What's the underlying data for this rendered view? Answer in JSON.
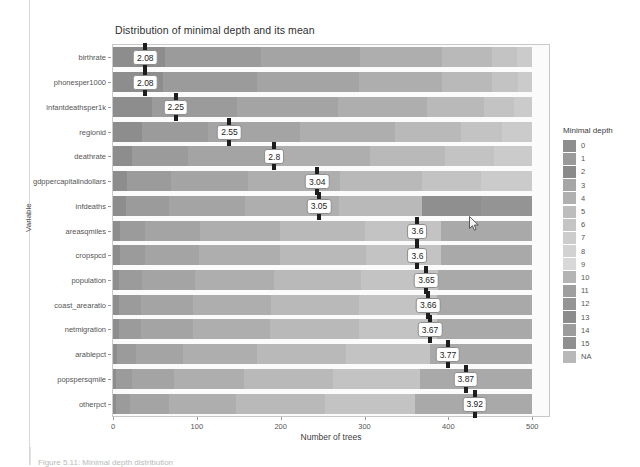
{
  "figure": {
    "caption": "Figure 5.11: Minimal depth distribution"
  },
  "chart_data": {
    "type": "bar",
    "title": "Distribution of minimal depth and its mean",
    "xlabel": "Number of trees",
    "ylabel": "Variable",
    "xlim": [
      0,
      520
    ],
    "xticks": [
      0,
      100,
      200,
      300,
      400,
      500
    ],
    "xtick_labels": [
      "0",
      "100",
      "200",
      "300",
      "400",
      "500"
    ],
    "grid": false,
    "orientation": "horizontal",
    "stacked": true,
    "legend": {
      "title": "Minimal depth",
      "position": "right",
      "entries": [
        {
          "label": "0",
          "color": "#8e8e8e"
        },
        {
          "label": "1",
          "color": "#9a9a9a"
        },
        {
          "label": "2",
          "color": "#8a8a8a"
        },
        {
          "label": "3",
          "color": "#a6a6a6"
        },
        {
          "label": "4",
          "color": "#b0b0b0"
        },
        {
          "label": "5",
          "color": "#bdbdbd"
        },
        {
          "label": "6",
          "color": "#c4c4c4"
        },
        {
          "label": "7",
          "color": "#cccccc"
        },
        {
          "label": "8",
          "color": "#d2d2d2"
        },
        {
          "label": "9",
          "color": "#d8d8d8"
        },
        {
          "label": "10",
          "color": "#b4b4b4"
        },
        {
          "label": "11",
          "color": "#9f9f9f"
        },
        {
          "label": "12",
          "color": "#949494"
        },
        {
          "label": "13",
          "color": "#8c8c8c"
        },
        {
          "label": "14",
          "color": "#9c9c9c"
        },
        {
          "label": "15",
          "color": "#8f8f8f"
        },
        {
          "label": "NA",
          "color": "#b8b8b8"
        }
      ]
    },
    "categories": [
      "birthrate",
      "phonesper1000",
      "infantdeathsper1k",
      "regionid",
      "deathrate",
      "gdppercapitalindollars",
      "infdeaths",
      "areasqmiles",
      "cropspcd",
      "population",
      "coast_arearatio",
      "netmigration",
      "arablepct",
      "popspersqmile",
      "otherpct"
    ],
    "mean_label": "mean minimal depth",
    "values": [
      2.08,
      2.08,
      2.25,
      2.55,
      2.8,
      3.04,
      3.05,
      3.6,
      3.6,
      3.65,
      3.66,
      3.67,
      3.77,
      3.87,
      3.92
    ],
    "value_labels": [
      "2.08",
      "2.08",
      "2.25",
      "2.55",
      "2.8",
      "3.04",
      "3.05",
      "3.6",
      "3.6",
      "3.65",
      "3.66",
      "3.67",
      "3.77",
      "3.87",
      "3.92"
    ],
    "total_trees": 500,
    "bars": [
      {
        "category": "birthrate",
        "mean": 2.08,
        "mean_label": "2.08",
        "segments": [
          {
            "depth": "0",
            "count": 62,
            "color": "#8d8d8d"
          },
          {
            "depth": "1",
            "count": 114,
            "color": "#9b9b9b"
          },
          {
            "depth": "2",
            "count": 119,
            "color": "#a4a4a4"
          },
          {
            "depth": "3",
            "count": 98,
            "color": "#aeaeae"
          },
          {
            "depth": "4",
            "count": 59,
            "color": "#b9b9b9"
          },
          {
            "depth": "5",
            "count": 30,
            "color": "#c3c3c3"
          },
          {
            "depth": "6",
            "count": 18,
            "color": "#cbcbcb"
          }
        ]
      },
      {
        "category": "phonesper1000",
        "mean": 2.08,
        "mean_label": "2.08",
        "segments": [
          {
            "depth": "0",
            "count": 60,
            "color": "#8d8d8d"
          },
          {
            "depth": "1",
            "count": 112,
            "color": "#9b9b9b"
          },
          {
            "depth": "2",
            "count": 121,
            "color": "#a4a4a4"
          },
          {
            "depth": "3",
            "count": 99,
            "color": "#aeaeae"
          },
          {
            "depth": "4",
            "count": 60,
            "color": "#b9b9b9"
          },
          {
            "depth": "5",
            "count": 31,
            "color": "#c3c3c3"
          },
          {
            "depth": "6",
            "count": 17,
            "color": "#cbcbcb"
          }
        ]
      },
      {
        "category": "infantdeathsper1k",
        "mean": 2.25,
        "mean_label": "2.25",
        "segments": [
          {
            "depth": "0",
            "count": 47,
            "color": "#8d8d8d"
          },
          {
            "depth": "1",
            "count": 101,
            "color": "#9b9b9b"
          },
          {
            "depth": "2",
            "count": 120,
            "color": "#a4a4a4"
          },
          {
            "depth": "3",
            "count": 106,
            "color": "#aeaeae"
          },
          {
            "depth": "4",
            "count": 68,
            "color": "#b9b9b9"
          },
          {
            "depth": "5",
            "count": 36,
            "color": "#c3c3c3"
          },
          {
            "depth": "6",
            "count": 22,
            "color": "#cbcbcb"
          }
        ]
      },
      {
        "category": "regionid",
        "mean": 2.55,
        "mean_label": "2.55",
        "segments": [
          {
            "depth": "0",
            "count": 34,
            "color": "#8d8d8d"
          },
          {
            "depth": "1",
            "count": 79,
            "color": "#9b9b9b"
          },
          {
            "depth": "2",
            "count": 110,
            "color": "#a4a4a4"
          },
          {
            "depth": "3",
            "count": 113,
            "color": "#aeaeae"
          },
          {
            "depth": "4",
            "count": 79,
            "color": "#b9b9b9"
          },
          {
            "depth": "5",
            "count": 49,
            "color": "#c3c3c3"
          },
          {
            "depth": "6",
            "count": 36,
            "color": "#cbcbcb"
          }
        ]
      },
      {
        "category": "deathrate",
        "mean": 2.8,
        "mean_label": "2.8",
        "segments": [
          {
            "depth": "0",
            "count": 23,
            "color": "#8d8d8d"
          },
          {
            "depth": "1",
            "count": 66,
            "color": "#9b9b9b"
          },
          {
            "depth": "2",
            "count": 103,
            "color": "#a4a4a4"
          },
          {
            "depth": "3",
            "count": 114,
            "color": "#aeaeae"
          },
          {
            "depth": "4",
            "count": 90,
            "color": "#b9b9b9"
          },
          {
            "depth": "5",
            "count": 58,
            "color": "#c3c3c3"
          },
          {
            "depth": "6",
            "count": 46,
            "color": "#cbcbcb"
          }
        ]
      },
      {
        "category": "gdppercapitalindollars",
        "mean": 3.04,
        "mean_label": "3.04",
        "segments": [
          {
            "depth": "0",
            "count": 17,
            "color": "#8d8d8d"
          },
          {
            "depth": "1",
            "count": 52,
            "color": "#9b9b9b"
          },
          {
            "depth": "2",
            "count": 92,
            "color": "#a4a4a4"
          },
          {
            "depth": "3",
            "count": 110,
            "color": "#aeaeae"
          },
          {
            "depth": "4",
            "count": 98,
            "color": "#b9b9b9"
          },
          {
            "depth": "5",
            "count": 70,
            "color": "#c3c3c3"
          },
          {
            "depth": "6",
            "count": 61,
            "color": "#cbcbcb"
          }
        ]
      },
      {
        "category": "infdeaths",
        "mean": 3.05,
        "mean_label": "3.05",
        "segments": [
          {
            "depth": "0",
            "count": 16,
            "color": "#8d8d8d"
          },
          {
            "depth": "1",
            "count": 51,
            "color": "#9b9b9b"
          },
          {
            "depth": "2",
            "count": 91,
            "color": "#a4a4a4"
          },
          {
            "depth": "3",
            "count": 111,
            "color": "#aeaeae"
          },
          {
            "depth": "4",
            "count": 99,
            "color": "#b9b9b9"
          },
          {
            "depth": "5",
            "count": 71,
            "color": "#8f8f8f"
          },
          {
            "depth": "6",
            "count": 61,
            "color": "#949494"
          }
        ]
      },
      {
        "category": "areasqmiles",
        "mean": 3.6,
        "mean_label": "3.6",
        "segments": [
          {
            "depth": "0",
            "count": 8,
            "color": "#8d8d8d"
          },
          {
            "depth": "1",
            "count": 30,
            "color": "#9b9b9b"
          },
          {
            "depth": "2",
            "count": 66,
            "color": "#a4a4a4"
          },
          {
            "depth": "3",
            "count": 95,
            "color": "#aeaeae"
          },
          {
            "depth": "4",
            "count": 102,
            "color": "#b9b9b9"
          },
          {
            "depth": "5",
            "count": 90,
            "color": "#c3c3c3"
          },
          {
            "depth": "6",
            "count": 109,
            "color": "#a9a9a9"
          }
        ]
      },
      {
        "category": "cropspcd",
        "mean": 3.6,
        "mean_label": "3.6",
        "segments": [
          {
            "depth": "0",
            "count": 8,
            "color": "#8d8d8d"
          },
          {
            "depth": "1",
            "count": 30,
            "color": "#9b9b9b"
          },
          {
            "depth": "2",
            "count": 65,
            "color": "#a4a4a4"
          },
          {
            "depth": "3",
            "count": 96,
            "color": "#aeaeae"
          },
          {
            "depth": "4",
            "count": 103,
            "color": "#b9b9b9"
          },
          {
            "depth": "5",
            "count": 89,
            "color": "#c3c3c3"
          },
          {
            "depth": "6",
            "count": 109,
            "color": "#a9a9a9"
          }
        ]
      },
      {
        "category": "population",
        "mean": 3.65,
        "mean_label": "3.65",
        "segments": [
          {
            "depth": "0",
            "count": 7,
            "color": "#8d8d8d"
          },
          {
            "depth": "1",
            "count": 28,
            "color": "#9b9b9b"
          },
          {
            "depth": "2",
            "count": 63,
            "color": "#a4a4a4"
          },
          {
            "depth": "3",
            "count": 94,
            "color": "#aeaeae"
          },
          {
            "depth": "4",
            "count": 104,
            "color": "#b9b9b9"
          },
          {
            "depth": "5",
            "count": 92,
            "color": "#c3c3c3"
          },
          {
            "depth": "6",
            "count": 112,
            "color": "#a9a9a9"
          }
        ]
      },
      {
        "category": "coast_arearatio",
        "mean": 3.66,
        "mean_label": "3.66",
        "segments": [
          {
            "depth": "0",
            "count": 7,
            "color": "#8d8d8d"
          },
          {
            "depth": "1",
            "count": 27,
            "color": "#9b9b9b"
          },
          {
            "depth": "2",
            "count": 62,
            "color": "#a4a4a4"
          },
          {
            "depth": "3",
            "count": 93,
            "color": "#aeaeae"
          },
          {
            "depth": "4",
            "count": 105,
            "color": "#b9b9b9"
          },
          {
            "depth": "5",
            "count": 93,
            "color": "#c3c3c3"
          },
          {
            "depth": "6",
            "count": 113,
            "color": "#a9a9a9"
          }
        ]
      },
      {
        "category": "netmigration",
        "mean": 3.67,
        "mean_label": "3.67",
        "segments": [
          {
            "depth": "0",
            "count": 7,
            "color": "#8d8d8d"
          },
          {
            "depth": "1",
            "count": 27,
            "color": "#9b9b9b"
          },
          {
            "depth": "2",
            "count": 61,
            "color": "#a4a4a4"
          },
          {
            "depth": "3",
            "count": 92,
            "color": "#aeaeae"
          },
          {
            "depth": "4",
            "count": 106,
            "color": "#b9b9b9"
          },
          {
            "depth": "5",
            "count": 94,
            "color": "#c3c3c3"
          },
          {
            "depth": "6",
            "count": 113,
            "color": "#a9a9a9"
          }
        ]
      },
      {
        "category": "arablepct",
        "mean": 3.77,
        "mean_label": "3.77",
        "segments": [
          {
            "depth": "0",
            "count": 5,
            "color": "#8d8d8d"
          },
          {
            "depth": "1",
            "count": 23,
            "color": "#9b9b9b"
          },
          {
            "depth": "2",
            "count": 56,
            "color": "#a4a4a4"
          },
          {
            "depth": "3",
            "count": 88,
            "color": "#aeaeae"
          },
          {
            "depth": "4",
            "count": 106,
            "color": "#b9b9b9"
          },
          {
            "depth": "5",
            "count": 100,
            "color": "#c3c3c3"
          },
          {
            "depth": "6",
            "count": 122,
            "color": "#a9a9a9"
          }
        ]
      },
      {
        "category": "popspersqmile",
        "mean": 3.87,
        "mean_label": "3.87",
        "segments": [
          {
            "depth": "0",
            "count": 4,
            "color": "#8d8d8d"
          },
          {
            "depth": "1",
            "count": 19,
            "color": "#9b9b9b"
          },
          {
            "depth": "2",
            "count": 50,
            "color": "#a4a4a4"
          },
          {
            "depth": "3",
            "count": 83,
            "color": "#aeaeae"
          },
          {
            "depth": "4",
            "count": 106,
            "color": "#b9b9b9"
          },
          {
            "depth": "5",
            "count": 104,
            "color": "#c3c3c3"
          },
          {
            "depth": "6",
            "count": 134,
            "color": "#a9a9a9"
          }
        ]
      },
      {
        "category": "otherpct",
        "mean": 3.92,
        "mean_label": "3.92",
        "segments": [
          {
            "depth": "0",
            "count": 3,
            "color": "#8d8d8d"
          },
          {
            "depth": "1",
            "count": 17,
            "color": "#9b9b9b"
          },
          {
            "depth": "2",
            "count": 47,
            "color": "#a4a4a4"
          },
          {
            "depth": "3",
            "count": 80,
            "color": "#aeaeae"
          },
          {
            "depth": "4",
            "count": 106,
            "color": "#b9b9b9"
          },
          {
            "depth": "5",
            "count": 107,
            "color": "#c3c3c3"
          },
          {
            "depth": "6",
            "count": 140,
            "color": "#a9a9a9"
          }
        ]
      }
    ]
  }
}
